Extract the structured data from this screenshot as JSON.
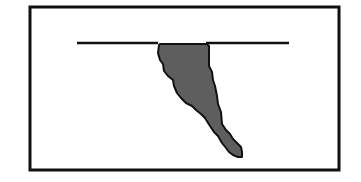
{
  "diagram": {
    "background": "#ffffff",
    "frame": {
      "x": 30,
      "y": 7,
      "width": 309,
      "height": 163,
      "stroke": "#111111",
      "stroke_width": 3
    },
    "surface_line": {
      "segments": [
        {
          "x1": 77,
          "y1": 43,
          "x2": 158,
          "y2": 43
        },
        {
          "x1": 206,
          "y1": 43,
          "x2": 289,
          "y2": 43
        }
      ],
      "stroke": "#111111",
      "stroke_width": 2.5
    },
    "shape": {
      "label": "",
      "fill": "#5e5e5e",
      "stroke": "#111111",
      "stroke_width": 2,
      "points": "159,45 160,44 207,44 209,46 209,66 212,72 213,80 215,86 217,96 218,104 221,112 222,124 226,130 230,134 233,139 237,143 241,147 242,152 242,157 238,157 233,155 229,152 226,148 222,143 218,136 214,132 210,126 205,118 201,114 196,110 192,106 186,103 181,98 177,93 174,86 173,80 168,76 164,71 163,64 160,60 158,53"
    }
  }
}
